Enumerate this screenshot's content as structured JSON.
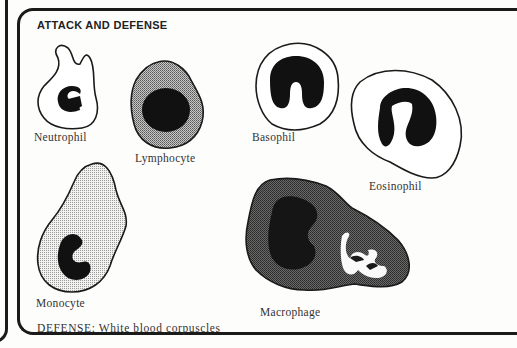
{
  "figure": {
    "title": "ATTACK AND DEFENSE",
    "caption": "DEFENSE: White blood corpuscles",
    "cells": [
      {
        "name": "Neutrophil",
        "icon": "neutrophil-cell-icon"
      },
      {
        "name": "Lymphocyte",
        "icon": "lymphocyte-cell-icon"
      },
      {
        "name": "Basophil",
        "icon": "basophil-cell-icon"
      },
      {
        "name": "Eosinophil",
        "icon": "eosinophil-cell-icon"
      },
      {
        "name": "Monocyte",
        "icon": "monocyte-cell-icon"
      },
      {
        "name": "Macrophage",
        "icon": "macrophage-cell-icon"
      }
    ]
  }
}
